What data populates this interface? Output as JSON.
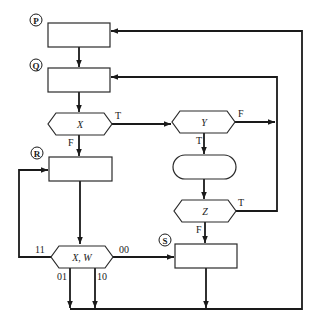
{
  "diagram": {
    "type": "flowchart",
    "connectors": {
      "P": "P",
      "Q": "Q",
      "R": "R",
      "S": "S"
    },
    "decisions": {
      "X": {
        "label": "X",
        "true_label": "T",
        "false_label": "F"
      },
      "Y": {
        "label": "Y",
        "true_label": "T",
        "false_label": "F"
      },
      "Z": {
        "label": "Z",
        "true_label": "T",
        "false_label": "F"
      },
      "XW": {
        "label": "X, W",
        "branch_11": "11",
        "branch_00": "00",
        "branch_01": "01",
        "branch_10": "10"
      }
    },
    "colors": {
      "stroke": "#1a1a1a",
      "fill": "#ffffff"
    }
  }
}
